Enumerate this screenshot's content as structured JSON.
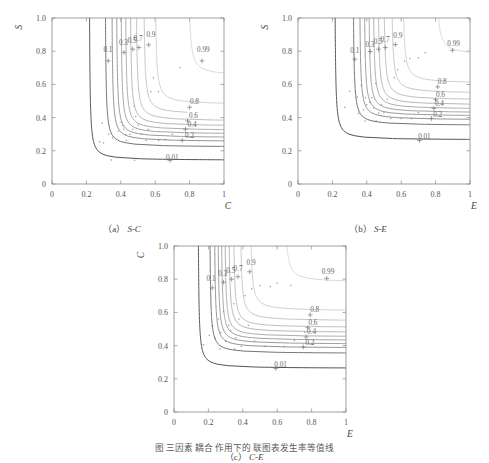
{
  "figure": {
    "caption_partial": "图    三因素    耦合    作用下的    联图表发生率等值线",
    "panels": [
      {
        "id": "a",
        "caption_prefix": "(a)",
        "caption_label": "S-C",
        "xlabel": "C",
        "ylabel": "S",
        "xticks": [
          "0",
          "0.2",
          "0.4",
          "0.6",
          "0.8",
          "1"
        ],
        "yticks": [
          "0",
          "0.2",
          "0.4",
          "0.6",
          "0.8",
          "1.0"
        ],
        "xlim": [
          0,
          1
        ],
        "ylim": [
          0,
          1
        ]
      },
      {
        "id": "b",
        "caption_prefix": "(b)",
        "caption_label": "S-E",
        "xlabel": "E",
        "ylabel": "S",
        "xticks": [
          "0",
          "0.2",
          "0.4",
          "0.6",
          "0.8",
          "1"
        ],
        "yticks": [
          "0",
          "0.2",
          "0.4",
          "0.6",
          "0.8",
          "1.0"
        ],
        "xlim": [
          0,
          1
        ],
        "ylim": [
          0,
          1
        ]
      },
      {
        "id": "c",
        "caption_prefix": "(c)",
        "caption_label": "C-E",
        "xlabel": "E",
        "ylabel": "C",
        "xticks": [
          "0",
          "0.2",
          "0.4",
          "0.6",
          "0.8",
          "1"
        ],
        "yticks": [
          "0",
          "0.2",
          "0.4",
          "0.6",
          "0.8",
          "1.0"
        ],
        "xlim": [
          0,
          1
        ],
        "ylim": [
          0,
          1
        ]
      }
    ]
  },
  "chart_data": [
    {
      "type": "line",
      "panel": "a",
      "title": "(a) S-C",
      "xlabel": "C",
      "ylabel": "S",
      "xlim": [
        0,
        1
      ],
      "ylim": [
        0,
        1
      ],
      "grid": false,
      "legend": "none",
      "contour_levels": [
        0.01,
        0.1,
        0.2,
        0.3,
        0.4,
        0.5,
        0.6,
        0.7,
        0.8,
        0.9,
        0.99
      ],
      "labeled_levels": [
        "0.01",
        "0.1",
        "0.2",
        "0.3",
        "0.4",
        "0.5",
        "0.6",
        "0.7",
        "0.8",
        "0.9",
        "0.99"
      ],
      "series": [
        {
          "name": "0.01",
          "x_asymptote": 0.215,
          "y_asymptote": 0.142,
          "label_pos": [
            0.7,
            0.142
          ],
          "marker_pos": [
            0.686,
            0.142
          ]
        },
        {
          "name": "0.1",
          "x_asymptote": 0.307,
          "y_asymptote": 0.222,
          "label_pos": [
            0.325,
            0.795
          ],
          "marker_pos": [
            0.327,
            0.742
          ]
        },
        {
          "name": "0.2",
          "x_asymptote": 0.345,
          "y_asymptote": 0.255,
          "label_pos": [
            0.8,
            0.275
          ],
          "marker_pos": [
            0.757,
            0.263
          ]
        },
        {
          "name": "0.3",
          "x_asymptote": 0.372,
          "y_asymptote": 0.278,
          "label_pos": [
            0.415,
            0.835
          ],
          "marker_pos": [
            0.419,
            0.793
          ]
        },
        {
          "name": "0.4",
          "x_asymptote": 0.398,
          "y_asymptote": 0.3,
          "label_pos": [
            0.815,
            0.345
          ],
          "marker_pos": [
            0.776,
            0.33
          ]
        },
        {
          "name": "0.5",
          "x_asymptote": 0.424,
          "y_asymptote": 0.322,
          "label_pos": [
            0.466,
            0.852
          ],
          "marker_pos": [
            0.47,
            0.812
          ]
        },
        {
          "name": "0.6",
          "x_asymptote": 0.452,
          "y_asymptote": 0.348,
          "label_pos": [
            0.822,
            0.4
          ],
          "marker_pos": [
            0.788,
            0.38
          ]
        },
        {
          "name": "0.7",
          "x_asymptote": 0.486,
          "y_asymptote": 0.378,
          "label_pos": [
            0.5,
            0.862
          ],
          "marker_pos": [
            0.505,
            0.822
          ]
        },
        {
          "name": "0.8",
          "x_asymptote": 0.53,
          "y_asymptote": 0.418,
          "label_pos": [
            0.828,
            0.48
          ],
          "marker_pos": [
            0.8,
            0.462
          ]
        },
        {
          "name": "0.9",
          "x_asymptote": 0.596,
          "y_asymptote": 0.478,
          "label_pos": [
            0.575,
            0.885
          ],
          "marker_pos": [
            0.562,
            0.838
          ]
        },
        {
          "name": "0.99",
          "x_asymptote": 0.79,
          "y_asymptote": 0.65,
          "label_pos": [
            0.88,
            0.795
          ],
          "marker_pos": [
            0.872,
            0.742
          ]
        }
      ],
      "scatter_points": [
        [
          0.292,
          0.368
        ],
        [
          0.276,
          0.255
        ],
        [
          0.3,
          0.248
        ],
        [
          0.33,
          0.3
        ],
        [
          0.352,
          0.278
        ],
        [
          0.386,
          0.318
        ],
        [
          0.402,
          0.372
        ],
        [
          0.412,
          0.352
        ],
        [
          0.418,
          0.33
        ],
        [
          0.428,
          0.298
        ],
        [
          0.432,
          0.262
        ],
        [
          0.452,
          0.3
        ],
        [
          0.47,
          0.33
        ],
        [
          0.478,
          0.47
        ],
        [
          0.487,
          0.406
        ],
        [
          0.5,
          0.356
        ],
        [
          0.52,
          0.3
        ],
        [
          0.548,
          0.262
        ],
        [
          0.56,
          0.33
        ],
        [
          0.575,
          0.556
        ],
        [
          0.59,
          0.64
        ],
        [
          0.62,
          0.556
        ],
        [
          0.48,
          0.143
        ],
        [
          0.345,
          0.145
        ],
        [
          0.66,
          0.268
        ],
        [
          0.7,
          0.3
        ],
        [
          0.745,
          0.7
        ],
        [
          0.62,
          0.262
        ]
      ]
    },
    {
      "type": "line",
      "panel": "b",
      "title": "(b) S-E",
      "xlabel": "E",
      "ylabel": "S",
      "xlim": [
        0,
        1
      ],
      "ylim": [
        0,
        1
      ],
      "grid": false,
      "legend": "none",
      "contour_levels": [
        0.01,
        0.1,
        0.2,
        0.3,
        0.4,
        0.5,
        0.6,
        0.7,
        0.8,
        0.9,
        0.99
      ],
      "labeled_levels": [
        "0.01",
        "0.1",
        "0.2",
        "0.3",
        "0.4",
        "0.5",
        "0.6",
        "0.7",
        "0.8",
        "0.9",
        "0.99"
      ],
      "series": [
        {
          "name": "0.01",
          "x_asymptote": 0.212,
          "y_asymptote": 0.265,
          "label_pos": [
            0.735,
            0.272
          ],
          "marker_pos": [
            0.706,
            0.262
          ]
        },
        {
          "name": "0.1",
          "x_asymptote": 0.318,
          "y_asymptote": 0.352,
          "label_pos": [
            0.33,
            0.79
          ],
          "marker_pos": [
            0.33,
            0.752
          ]
        },
        {
          "name": "0.2",
          "x_asymptote": 0.355,
          "y_asymptote": 0.385,
          "label_pos": [
            0.812,
            0.405
          ],
          "marker_pos": [
            0.776,
            0.395
          ]
        },
        {
          "name": "0.3",
          "x_asymptote": 0.382,
          "y_asymptote": 0.408,
          "label_pos": [
            0.418,
            0.828
          ],
          "marker_pos": [
            0.42,
            0.798
          ]
        },
        {
          "name": "0.4",
          "x_asymptote": 0.408,
          "y_asymptote": 0.428,
          "label_pos": [
            0.822,
            0.468
          ],
          "marker_pos": [
            0.79,
            0.455
          ]
        },
        {
          "name": "0.5",
          "x_asymptote": 0.434,
          "y_asymptote": 0.45,
          "label_pos": [
            0.466,
            0.845
          ],
          "marker_pos": [
            0.468,
            0.812
          ]
        },
        {
          "name": "0.6",
          "x_asymptote": 0.462,
          "y_asymptote": 0.475,
          "label_pos": [
            0.828,
            0.522
          ],
          "marker_pos": [
            0.8,
            0.508
          ]
        },
        {
          "name": "0.7",
          "x_asymptote": 0.495,
          "y_asymptote": 0.505,
          "label_pos": [
            0.506,
            0.858
          ],
          "marker_pos": [
            0.508,
            0.822
          ]
        },
        {
          "name": "0.8",
          "x_asymptote": 0.54,
          "y_asymptote": 0.545,
          "label_pos": [
            0.838,
            0.6
          ],
          "marker_pos": [
            0.812,
            0.585
          ]
        },
        {
          "name": "0.9",
          "x_asymptote": 0.605,
          "y_asymptote": 0.605,
          "label_pos": [
            0.58,
            0.88
          ],
          "marker_pos": [
            0.566,
            0.84
          ]
        },
        {
          "name": "0.99",
          "x_asymptote": 0.8,
          "y_asymptote": 0.775,
          "label_pos": [
            0.905,
            0.832
          ],
          "marker_pos": [
            0.898,
            0.805
          ]
        }
      ],
      "scatter_points": [
        [
          0.272,
          0.462
        ],
        [
          0.3,
          0.558
        ],
        [
          0.345,
          0.522
        ],
        [
          0.352,
          0.425
        ],
        [
          0.368,
          0.595
        ],
        [
          0.382,
          0.448
        ],
        [
          0.392,
          0.52
        ],
        [
          0.4,
          0.478
        ],
        [
          0.418,
          0.492
        ],
        [
          0.428,
          0.52
        ],
        [
          0.44,
          0.458
        ],
        [
          0.452,
          0.605
        ],
        [
          0.468,
          0.428
        ],
        [
          0.486,
          0.478
        ],
        [
          0.5,
          0.43
        ],
        [
          0.52,
          0.51
        ],
        [
          0.54,
          0.395
        ],
        [
          0.56,
          0.64
        ],
        [
          0.58,
          0.688
        ],
        [
          0.6,
          0.395
        ],
        [
          0.62,
          0.74
        ],
        [
          0.65,
          0.755
        ],
        [
          0.7,
          0.76
        ],
        [
          0.74,
          0.79
        ],
        [
          0.455,
          0.38
        ],
        [
          0.39,
          0.38
        ],
        [
          0.66,
          0.395
        ],
        [
          0.7,
          0.43
        ]
      ]
    },
    {
      "type": "line",
      "panel": "c",
      "title": "(c) C-E",
      "xlabel": "E",
      "ylabel": "C",
      "xlim": [
        0,
        1
      ],
      "ylim": [
        0,
        1
      ],
      "grid": false,
      "legend": "none",
      "contour_levels": [
        0.01,
        0.1,
        0.2,
        0.3,
        0.4,
        0.5,
        0.6,
        0.7,
        0.8,
        0.9,
        0.99
      ],
      "labeled_levels": [
        "0.01",
        "0.1",
        "0.2",
        "0.3",
        "0.4",
        "0.5",
        "0.6",
        "0.7",
        "0.8",
        "0.9",
        "0.99"
      ],
      "series": [
        {
          "name": "0.01",
          "x_asymptote": 0.138,
          "y_asymptote": 0.262,
          "label_pos": [
            0.62,
            0.272
          ],
          "marker_pos": [
            0.592,
            0.262
          ]
        },
        {
          "name": "0.1",
          "x_asymptote": 0.205,
          "y_asymptote": 0.352,
          "label_pos": [
            0.215,
            0.79
          ],
          "marker_pos": [
            0.222,
            0.748
          ]
        },
        {
          "name": "0.2",
          "x_asymptote": 0.232,
          "y_asymptote": 0.385,
          "label_pos": [
            0.79,
            0.405
          ],
          "marker_pos": [
            0.752,
            0.392
          ]
        },
        {
          "name": "0.3",
          "x_asymptote": 0.252,
          "y_asymptote": 0.408,
          "label_pos": [
            0.283,
            0.818
          ],
          "marker_pos": [
            0.288,
            0.782
          ]
        },
        {
          "name": "0.4",
          "x_asymptote": 0.272,
          "y_asymptote": 0.43,
          "label_pos": [
            0.8,
            0.468
          ],
          "marker_pos": [
            0.768,
            0.452
          ]
        },
        {
          "name": "0.5",
          "x_asymptote": 0.292,
          "y_asymptote": 0.452,
          "label_pos": [
            0.33,
            0.838
          ],
          "marker_pos": [
            0.335,
            0.8
          ]
        },
        {
          "name": "0.6",
          "x_asymptote": 0.315,
          "y_asymptote": 0.478,
          "label_pos": [
            0.808,
            0.522
          ],
          "marker_pos": [
            0.778,
            0.508
          ]
        },
        {
          "name": "0.7",
          "x_asymptote": 0.342,
          "y_asymptote": 0.508,
          "label_pos": [
            0.372,
            0.852
          ],
          "marker_pos": [
            0.372,
            0.815
          ]
        },
        {
          "name": "0.8",
          "x_asymptote": 0.382,
          "y_asymptote": 0.548,
          "label_pos": [
            0.818,
            0.6
          ],
          "marker_pos": [
            0.792,
            0.585
          ]
        },
        {
          "name": "0.9",
          "x_asymptote": 0.44,
          "y_asymptote": 0.608,
          "label_pos": [
            0.448,
            0.885
          ],
          "marker_pos": [
            0.44,
            0.845
          ]
        },
        {
          "name": "0.99",
          "x_asymptote": 0.64,
          "y_asymptote": 0.78,
          "label_pos": [
            0.895,
            0.83
          ],
          "marker_pos": [
            0.888,
            0.805
          ]
        }
      ],
      "scatter_points": [
        [
          0.172,
          0.405
        ],
        [
          0.205,
          0.462
        ],
        [
          0.222,
          0.52
        ],
        [
          0.238,
          0.448
        ],
        [
          0.258,
          0.56
        ],
        [
          0.272,
          0.478
        ],
        [
          0.288,
          0.605
        ],
        [
          0.3,
          0.425
        ],
        [
          0.318,
          0.522
        ],
        [
          0.33,
          0.49
        ],
        [
          0.348,
          0.652
        ],
        [
          0.36,
          0.448
        ],
        [
          0.378,
          0.56
        ],
        [
          0.392,
          0.395
        ],
        [
          0.412,
          0.7
        ],
        [
          0.432,
          0.522
        ],
        [
          0.452,
          0.742
        ],
        [
          0.468,
          0.428
        ],
        [
          0.5,
          0.762
        ],
        [
          0.53,
          0.395
        ],
        [
          0.56,
          0.755
        ],
        [
          0.6,
          0.775
        ],
        [
          0.64,
          0.395
        ],
        [
          0.68,
          0.762
        ],
        [
          0.268,
          0.38
        ],
        [
          0.352,
          0.38
        ],
        [
          0.7,
          0.43
        ],
        [
          0.76,
          0.48
        ]
      ]
    }
  ]
}
